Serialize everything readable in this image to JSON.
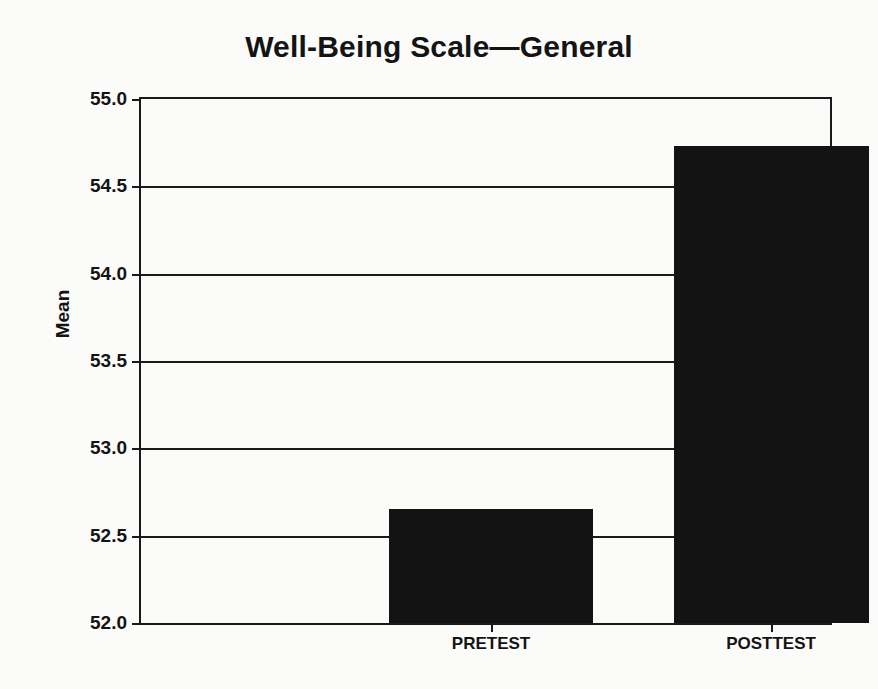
{
  "chart_data": {
    "type": "bar",
    "title": "Well-Being Scale—General",
    "xlabel": "",
    "ylabel": "Mean",
    "categories": [
      "PRETEST",
      "POSTTEST"
    ],
    "values": [
      52.65,
      54.73
    ],
    "series": [
      {
        "name": "Mean",
        "values": [
          52.65,
          54.73
        ]
      }
    ],
    "ylim": [
      52.0,
      55.0
    ],
    "ytick_values": [
      52.0,
      52.5,
      53.0,
      53.5,
      54.0,
      54.5,
      55.0
    ],
    "ytick_labels": [
      "52.0",
      "52.5",
      "53.0",
      "53.5",
      "54.0",
      "54.5",
      "55.0"
    ],
    "grid": true,
    "grid_axis": "y",
    "legend": false,
    "legend_position": "none",
    "bar_color": "#131313",
    "axis_color": "#1a1a1a",
    "text_color": "#141414",
    "background_color": "#fbfbf9"
  }
}
